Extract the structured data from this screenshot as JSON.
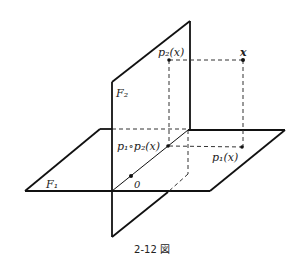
{
  "figure": {
    "caption": "2-12 図",
    "planes": {
      "F1": "F₁",
      "F2": "F₂"
    },
    "points": {
      "x": "x",
      "p2x": "p₂(x)",
      "p1x": "p₁(x)",
      "p1p2x": "p₁∘p₂(x)",
      "origin": "0"
    }
  }
}
